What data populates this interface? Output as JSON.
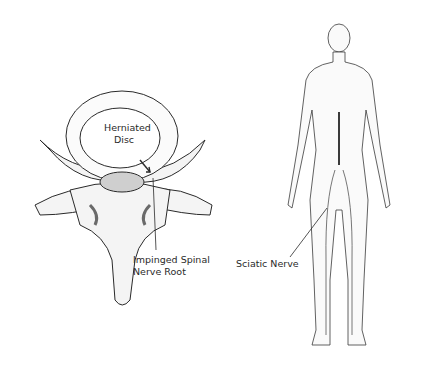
{
  "diagram": {
    "vertebra": {
      "labels": {
        "disc_line1": "Herniated",
        "disc_line2": "Disc",
        "nerve_line1": "Impinged Spinal",
        "nerve_line2": "Nerve Root"
      }
    },
    "body": {
      "labels": {
        "sciatic": "Sciatic Nerve"
      }
    },
    "colors": {
      "line": "#2a2a2a",
      "fill": "#f4f4f4",
      "shade": "#6a6a6a"
    }
  }
}
